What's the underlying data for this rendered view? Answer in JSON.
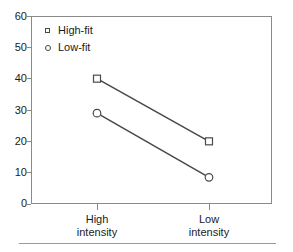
{
  "chart_data": {
    "type": "line",
    "title": "",
    "subtitle": "",
    "xlabel": "",
    "ylabel": "",
    "categories": [
      "High intensity",
      "Low intensity"
    ],
    "category_lines": [
      [
        "High",
        "intensity"
      ],
      [
        "Low",
        "intensity"
      ]
    ],
    "series": [
      {
        "name": "High-fit",
        "marker": "open-square",
        "values": [
          40,
          20
        ]
      },
      {
        "name": "Low-fit",
        "marker": "open-circle",
        "values": [
          29,
          8.5
        ]
      }
    ],
    "ylim": [
      0,
      60
    ],
    "yticks": [
      0,
      10,
      20,
      30,
      40,
      50,
      60
    ],
    "ytick_labels": [
      "0",
      "10",
      "20",
      "30",
      "40",
      "50",
      "60"
    ],
    "grid": false,
    "legend_position": "top-left",
    "legend_entries": [
      "High-fit",
      "Low-fit"
    ],
    "colors": {
      "line": "#4a4a4a",
      "marker_edge": "#4a4a4a",
      "marker_face": "#ffffff",
      "frame": "#8a8a8a",
      "text": "#1a1a1a",
      "rule": "#9a9a9a",
      "background": "#ffffff"
    }
  }
}
